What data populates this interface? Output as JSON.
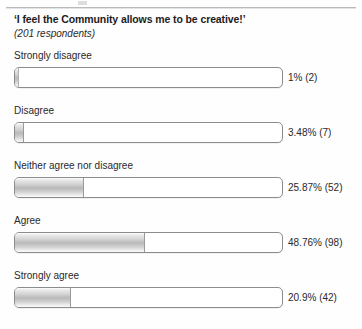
{
  "page": {
    "background": "#ffffff",
    "divider_color": "#b9babb"
  },
  "header": {
    "title": "‘I feel the Community allows me to be creative!’",
    "subtitle": "(201 respondents)"
  },
  "chart_data": {
    "type": "bar",
    "orientation": "horizontal",
    "title": "‘I feel the Community allows me to be creative!’",
    "subtitle": "(201 respondents)",
    "xlabel": "",
    "ylabel": "",
    "xlim": [
      0,
      100
    ],
    "grid": false,
    "legend": false,
    "respondents": 201,
    "categories": [
      "Strongly disagree",
      "Disagree",
      "Neither agree nor disagree",
      "Agree",
      "Strongly agree"
    ],
    "values": [
      1,
      3.48,
      25.87,
      48.76,
      20.9
    ],
    "counts": [
      2,
      7,
      52,
      98,
      42
    ],
    "value_labels": [
      "1% (2)",
      "3.48% (7)",
      "25.87% (52)",
      "48.76% (98)",
      "20.9% (42)"
    ],
    "bar_fill_color": "#c4c4c4",
    "bar_track_color": "#ffffff",
    "bar_border_color": "#8b8c8e"
  },
  "rows": [
    {
      "label": "Strongly disagree",
      "value_label": "1% (2)",
      "percent": 1
    },
    {
      "label": "Disagree",
      "value_label": "3.48% (7)",
      "percent": 3.48
    },
    {
      "label": "Neither agree nor disagree",
      "value_label": "25.87% (52)",
      "percent": 25.87
    },
    {
      "label": "Agree",
      "value_label": "48.76% (98)",
      "percent": 48.76
    },
    {
      "label": "Strongly agree",
      "value_label": "20.9% (42)",
      "percent": 20.9
    }
  ]
}
